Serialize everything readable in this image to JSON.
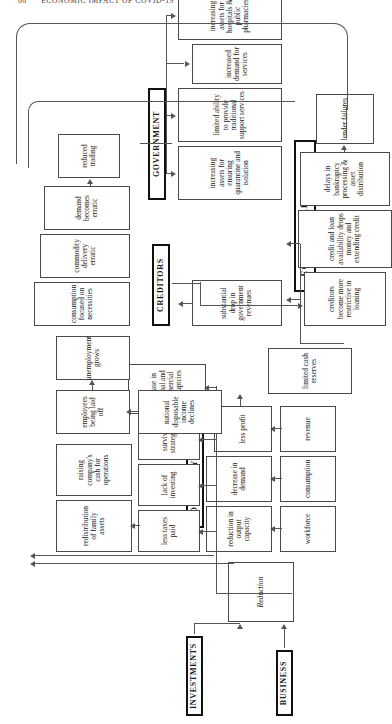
{
  "page": {
    "header_number": "66",
    "header_title": "ECONOMIC IMPACT OF COVID-19"
  },
  "diagram": {
    "orientation": "rotated-90-ccw",
    "group_labels": {
      "business": "BUSINESS",
      "investments": "INVESTMENTS",
      "commodity_markets": "COMMODITY MARKETS",
      "government": "GOVERNMENT",
      "creditors": "CREDITORS",
      "outcome": "ECONOMIC RECESSION"
    },
    "nodes": {
      "reduction": "Reduction",
      "workforce": "workforce",
      "consumption": "consumption",
      "revenue": "revenue",
      "limited_cash_reserves": "limited cash reserves",
      "reduction_output_capacity": "reduction in output capacity",
      "decrease_in_demand": "decrease in demand",
      "less_profit": "less profit",
      "less_taxes_paid": "less taxes paid",
      "lack_of_investing": "lack of investing",
      "survival_strategies": "survival strategies",
      "increase_bankruptcies": "increase in personal and commercial bankruptcies",
      "redistribution_family_assets": "redistribution of family assets",
      "raising_company_cash": "raising company's cash for operations",
      "employees_laid_off": "employees being laid off",
      "national_disposable_income": "national disposable income declines",
      "unemployment_grows": "unemployment grows",
      "consumption_necessities": "consumption focused on necessities",
      "commodity_delivery_erratic": "commodity delivery erratic",
      "demand_becomes_erratic": "demand becomes erratic",
      "reduced_trading": "reduced trading",
      "substantial_drop_revenues": "substantial drop in government revenues",
      "gov_quarantine_assets": "increasing assets for ensuring quarantine and  isolation",
      "gov_limited_support": "limited ability to provide traditional support services",
      "gov_increased_demand": "increased demand for services",
      "gov_hospital_assets": "increasing assets for hospitals & public pharmacies",
      "creditors_restrictive": "creditors become more restrictive in loaning",
      "credit_availability_drops": "credit and loan availability drops money and extending credit",
      "bankruptcy_delays": "delays in bankruptcy processing & asset distribution",
      "lender_failures": "lender failures"
    }
  }
}
